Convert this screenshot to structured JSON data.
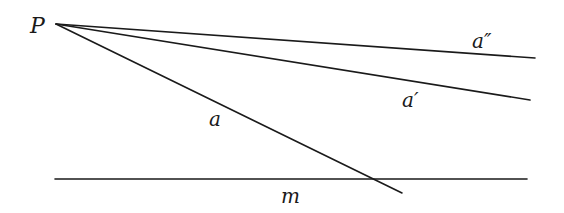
{
  "diagram": {
    "point": {
      "label": "P",
      "x": 56,
      "y": 24,
      "label_x": 30,
      "label_y": 33
    },
    "lines": [
      {
        "name": "a-double-prime",
        "label": "a″",
        "x1": 56,
        "y1": 24,
        "x2": 535,
        "y2": 58,
        "label_x": 472,
        "label_y": 48
      },
      {
        "name": "a-prime",
        "label": "a′",
        "x1": 56,
        "y1": 24,
        "x2": 530,
        "y2": 100,
        "label_x": 402,
        "label_y": 107
      },
      {
        "name": "a",
        "label": "a",
        "x1": 56,
        "y1": 24,
        "x2": 402,
        "y2": 193,
        "label_x": 209,
        "label_y": 126
      },
      {
        "name": "m",
        "label": "m",
        "x1": 55,
        "y1": 179,
        "x2": 527,
        "y2": 179,
        "label_x": 281,
        "label_y": 203
      }
    ]
  }
}
